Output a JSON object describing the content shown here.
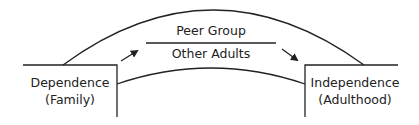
{
  "diagram": {
    "left_box": {
      "line1": "Dependence",
      "line2": "(Family)"
    },
    "right_box": {
      "line1": "Independence",
      "line2": "(Adulthood)"
    },
    "bridge": {
      "top_label": "Peer Group",
      "bottom_label": "Other Adults"
    },
    "colors": {
      "stroke": "#222222",
      "background": "#ffffff"
    }
  }
}
